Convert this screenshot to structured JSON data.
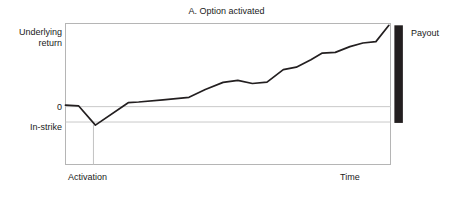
{
  "figure": {
    "title": "A. Option activated",
    "background": "#ffffff"
  },
  "axes": {
    "y_axis_label": "Underlying\nreturn",
    "y_axis_label_line1": "Underlying",
    "y_axis_label_line2": "return",
    "x_axis_label": "Time",
    "y_ticks": [
      "0",
      "In-strike"
    ],
    "x_ticks": [
      "Activation"
    ]
  },
  "annotations": {
    "payout_label": "Payout",
    "payout_bar_color": "#231f20",
    "activation_marker": "Activation"
  },
  "colors": {
    "frame": "#b0b0b0",
    "gridline": "#c8c8c8",
    "series_line": "#231f20",
    "payout_bar": "#231f20",
    "text": "#1a1a1a"
  },
  "chart_data": {
    "type": "line",
    "title": "A. Option activated",
    "xlabel": "Time",
    "ylabel": "Underlying return",
    "grid": true,
    "legend": "none",
    "xlim": [
      0,
      100
    ],
    "ylim": [
      -3.2,
      4.6
    ],
    "y_reference_lines": [
      {
        "label": "0",
        "value": 0
      },
      {
        "label": "In-strike",
        "value": -0.85
      }
    ],
    "x_reference_lines": [
      {
        "label": "Activation",
        "value": 8.6,
        "from_value": -1.0,
        "to_value": -3.2
      }
    ],
    "annotations": [
      {
        "name": "payout-bar",
        "label": "Payout",
        "type": "vertical-bar",
        "x": 102.5,
        "y_from": -0.9,
        "y_to": 4.5
      }
    ],
    "series": [
      {
        "name": "Underlying return path",
        "color": "#231f20",
        "x": [
          0.0,
          4.0,
          9.2,
          19.3,
          22.5,
          30.0,
          38.0,
          43.0,
          48.5,
          53.0,
          57.5,
          62.0,
          67.0,
          71.0,
          75.5,
          79.0,
          83.0,
          87.5,
          91.5,
          95.5,
          99.5
        ],
        "y": [
          0.08,
          0.05,
          -1.02,
          0.22,
          0.26,
          0.38,
          0.52,
          0.95,
          1.34,
          1.46,
          1.28,
          1.35,
          2.05,
          2.18,
          2.6,
          2.96,
          3.0,
          3.32,
          3.52,
          3.6,
          4.5
        ]
      }
    ]
  }
}
